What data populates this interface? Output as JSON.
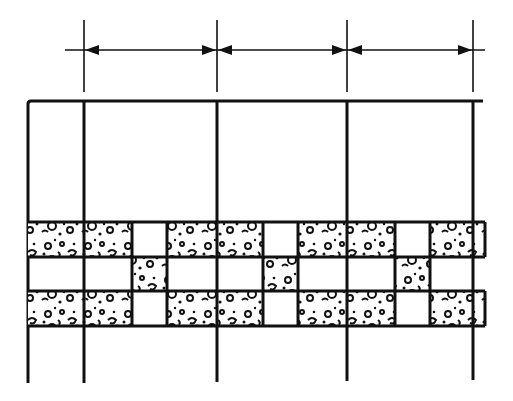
{
  "diagram": {
    "type": "architectural-elevation",
    "colors": {
      "line": "#111111",
      "background": "#ffffff",
      "texture": "#111111"
    },
    "grid_lines_x": [
      84,
      217,
      347,
      473
    ],
    "frame": {
      "left_x": 28,
      "top_y": 101,
      "right_x": 483,
      "bottom_y": 383
    },
    "dimension_line": {
      "y": 50,
      "x_start": 65,
      "x_end": 483,
      "tick_top": 20,
      "tick_bottom": 92
    },
    "band": {
      "rows": [
        {
          "name": "top-row",
          "y": 222,
          "h": 35
        },
        {
          "name": "middle-row",
          "y": 257,
          "h": 34
        },
        {
          "name": "bottom-row",
          "y": 291,
          "h": 35
        }
      ],
      "right_x": 485
    }
  }
}
